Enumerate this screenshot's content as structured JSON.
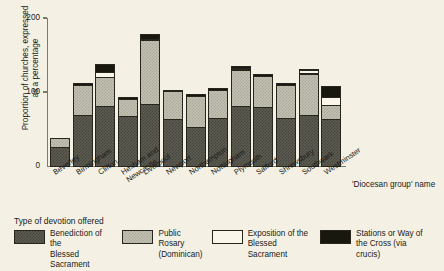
{
  "chart_data": {
    "type": "bar",
    "stacked": true,
    "title": "",
    "xlabel": "'Diocesan group' name",
    "ylabel": "Proportion of churches, expressed\nas a percentage",
    "ylim": [
      0,
      200
    ],
    "yticks": [
      0,
      100,
      200
    ],
    "ytick_labels": [
      "0",
      "100",
      "200"
    ],
    "grid": false,
    "legend_title": "Type of devotion offered",
    "legend_position": "bottom",
    "categories": [
      "Beverley",
      "Birmingham",
      "Clifton",
      "Hexham and\nNewcastle",
      "Liverpool",
      "Newport",
      "Northampton",
      "Nottingham",
      "Plymouth",
      "Salford",
      "Shrewsbury",
      "Southwark",
      "Westminster"
    ],
    "series": [
      {
        "name": "Benediction of the Blessed Sacrament",
        "short_name": "Benediction of the\nBlessed Sacrament",
        "color": "#5d5c52",
        "pattern": "dark-hatch",
        "values": [
          27,
          70,
          82,
          69,
          85,
          64,
          54,
          66,
          82,
          81,
          66,
          70,
          65
        ]
      },
      {
        "name": "Public Rosary (Dominican)",
        "short_name": "Public Rosary\n(Dominican)",
        "color": "#c2c0b0",
        "pattern": "light-hatch",
        "values": [
          13,
          42,
          40,
          24,
          88,
          39,
          43,
          39,
          50,
          43,
          46,
          57,
          19
        ]
      },
      {
        "name": "Exposition of the Blessed Sacrament",
        "short_name": "Exposition of the\nBlessed Sacrament",
        "color": "#faf7ea",
        "pattern": "none",
        "values": [
          0,
          0,
          8,
          0,
          0,
          0,
          0,
          0,
          3,
          0,
          0,
          6,
          12
        ]
      },
      {
        "name": "Stations or Way of the Cross (via crucis)",
        "short_name": "Stations or Way of\nthe Cross (via crucis)",
        "color": "#18180f",
        "pattern": "solid",
        "values": [
          0,
          3,
          12,
          3,
          9,
          3,
          3,
          4,
          5,
          4,
          4,
          3,
          16
        ]
      }
    ]
  }
}
